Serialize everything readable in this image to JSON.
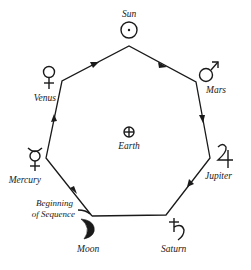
{
  "diagram": {
    "type": "heptagon-cycle",
    "center": {
      "label": "Earth",
      "symbol": "earth-symbol"
    },
    "nodes": [
      {
        "id": "sun",
        "label": "Sun",
        "symbol": "sun-symbol"
      },
      {
        "id": "mars",
        "label": "Mars",
        "symbol": "mars-symbol"
      },
      {
        "id": "jupiter",
        "label": "Jupiter",
        "symbol": "jupiter-symbol"
      },
      {
        "id": "saturn",
        "label": "Saturn",
        "symbol": "saturn-symbol"
      },
      {
        "id": "moon",
        "label": "Moon",
        "symbol": "moon-symbol"
      },
      {
        "id": "mercury",
        "label": "Mercury",
        "symbol": "mercury-symbol"
      },
      {
        "id": "venus",
        "label": "Venus",
        "symbol": "venus-symbol"
      }
    ],
    "sequence_direction": [
      "moon",
      "mercury",
      "venus",
      "sun",
      "mars",
      "jupiter",
      "saturn",
      "moon"
    ],
    "annotation": {
      "line1": "Beginning",
      "line2": "of Sequence"
    }
  },
  "labels": {
    "sun": "Sun",
    "mars": "Mars",
    "jupiter": "Jupiter",
    "saturn": "Saturn",
    "moon": "Moon",
    "mercury": "Mercury",
    "venus": "Venus",
    "earth": "Earth",
    "begin1": "Beginning",
    "begin2": "of Sequence"
  }
}
